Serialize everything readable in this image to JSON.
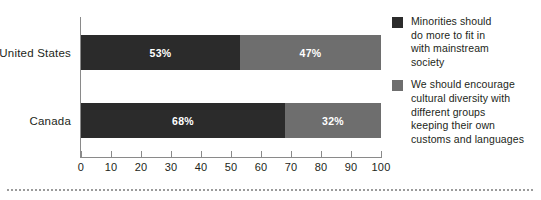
{
  "chart_data": {
    "type": "bar",
    "orientation": "horizontal",
    "stacked": true,
    "title": "",
    "xlabel": "",
    "ylabel": "",
    "categories": [
      "United States",
      "Canada"
    ],
    "series": [
      {
        "name": "Minorities should do more to fit in with mainstream society",
        "color": "#2b2b2b",
        "values": [
          53,
          47
        ]
      },
      {
        "name": "We should encourage cultural diversity with different groups keeping their own customs and languages",
        "color": "#6e6e6e",
        "values": [
          47,
          32
        ]
      }
    ],
    "bars": [
      {
        "category": "United States",
        "segments": [
          {
            "series": 0,
            "value": 53,
            "label": "53%",
            "color": "#2b2b2b"
          },
          {
            "series": 1,
            "value": 47,
            "label": "47%",
            "color": "#6e6e6e"
          }
        ]
      },
      {
        "category": "Canada",
        "segments": [
          {
            "series": 0,
            "value": 68,
            "label": "68%",
            "color": "#2b2b2b"
          },
          {
            "series": 1,
            "value": 32,
            "label": "32%",
            "color": "#6e6e6e"
          }
        ]
      }
    ],
    "xlim": [
      0,
      100
    ],
    "xticks": [
      0,
      10,
      20,
      30,
      40,
      50,
      60,
      70,
      80,
      90,
      100
    ],
    "xtick_labels": [
      "0",
      "10",
      "20",
      "30",
      "40",
      "50",
      "60",
      "70",
      "80",
      "90",
      "100"
    ],
    "grid": false,
    "legend_position": "right",
    "legend": [
      {
        "color": "#2b2b2b",
        "lines": [
          "Minorities should",
          "do more to fit in",
          "with mainstream",
          "society"
        ]
      },
      {
        "color": "#6e6e6e",
        "lines": [
          "We should encourage",
          "cultural diversity with",
          "different groups",
          "keeping their own",
          "customs and languages"
        ]
      }
    ],
    "axis_color": "#8a8a8a",
    "value_label_color": "#ffffff",
    "background": "#ffffff"
  }
}
